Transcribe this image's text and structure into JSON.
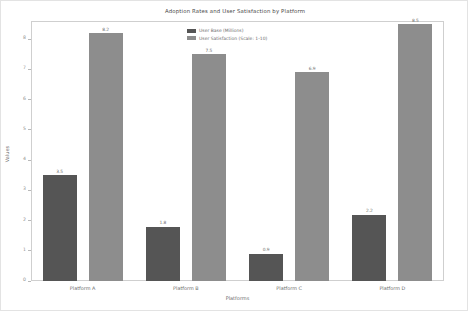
{
  "chart_data": {
    "type": "bar",
    "title": "Adoption Rates and User Satisfaction by Platform",
    "xlabel": "Platforms",
    "ylabel": "Values",
    "categories": [
      "Platform A",
      "Platform B",
      "Platform C",
      "Platform D"
    ],
    "series": [
      {
        "name": "User Base (Millions)",
        "color": "#555555",
        "values": [
          3.5,
          1.8,
          0.9,
          2.2
        ]
      },
      {
        "name": "User Satisfaction (Scale: 1-10)",
        "color": "#8d8d8d",
        "values": [
          8.2,
          7.5,
          6.9,
          8.5
        ]
      }
    ],
    "ylim": [
      0,
      8.6
    ],
    "yticks": [
      0,
      1,
      2,
      3,
      4,
      5,
      6,
      7,
      8
    ],
    "ytick_labels": [
      "0",
      "1",
      "2",
      "3",
      "4",
      "5",
      "6",
      "7",
      "8"
    ],
    "grid": false,
    "legend_position": "upper center",
    "data_labels": true,
    "data_label_values": [
      [
        "3.5",
        "8.2"
      ],
      [
        "1.8",
        "7.5"
      ],
      [
        "0.9",
        "6.9"
      ],
      [
        "2.2",
        "8.5"
      ]
    ]
  },
  "figure": {
    "background_color": "#ffffff",
    "border_color": "#e3e3e3",
    "axes_border_color": "#cfcfcf"
  }
}
